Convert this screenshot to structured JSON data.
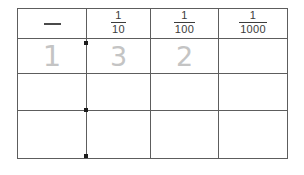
{
  "worksheet": {
    "title": "Place value chart with decimal fractions",
    "ink_color": "#c4c4c4",
    "line_color": "#5d5d5d",
    "dot_color": "#1c1c1c"
  },
  "table": {
    "columns": [
      {
        "key": "ones",
        "header_type": "dash",
        "header_label": "—",
        "numerator": "",
        "denominator": ""
      },
      {
        "key": "tenths",
        "header_type": "fraction",
        "header_label": "1/10",
        "numerator": "1",
        "denominator": "10"
      },
      {
        "key": "hundredths",
        "header_type": "fraction",
        "header_label": "1/100",
        "numerator": "1",
        "denominator": "100"
      },
      {
        "key": "thousandths",
        "header_type": "fraction",
        "header_label": "1/1000",
        "numerator": "1",
        "denominator": "1000"
      }
    ],
    "rows": [
      {
        "cells": [
          "1",
          "3",
          "2",
          ""
        ]
      },
      {
        "cells": [
          "",
          "",
          "",
          ""
        ]
      },
      {
        "cells": [
          "",
          "",
          "",
          ""
        ]
      }
    ],
    "decimal_points": [
      {
        "label": "decimal-point-row-1"
      },
      {
        "label": "decimal-point-row-2"
      },
      {
        "label": "decimal-point-row-3"
      }
    ]
  }
}
